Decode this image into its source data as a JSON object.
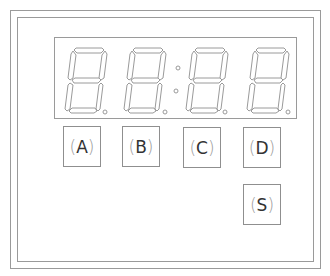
{
  "device": {
    "display": {
      "digits": [
        "8",
        "8",
        "8",
        "8"
      ],
      "segment_stroke_color": "#9a9a9a",
      "colon": true,
      "decimal_points": [
        true,
        true,
        true,
        true
      ]
    },
    "buttons": [
      {
        "id": "A",
        "label": "A"
      },
      {
        "id": "B",
        "label": "B"
      },
      {
        "id": "C",
        "label": "C"
      },
      {
        "id": "D",
        "label": "D"
      },
      {
        "id": "S",
        "label": "S"
      }
    ],
    "paren_open": "(",
    "paren_close": ")"
  }
}
